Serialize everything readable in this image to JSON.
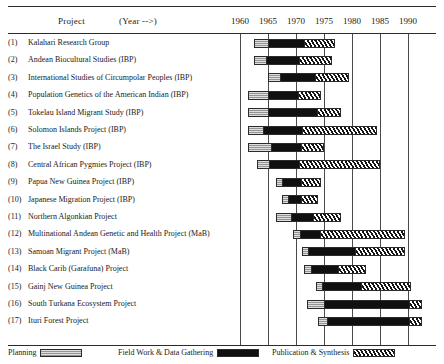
{
  "header": {
    "project_label": "Project",
    "year_label": "(Year -->)"
  },
  "legend": [
    {
      "key": "planning",
      "label": "Planning"
    },
    {
      "key": "field",
      "label": "Field Work & Data Gathering"
    },
    {
      "key": "publication",
      "label": "Publication & Synthesis"
    }
  ],
  "colors": {
    "planning": "#b4b4b4",
    "field": "#101010",
    "publication": "#ffffff",
    "rule": "#2b2b2b",
    "gridline": "#4a4a4a"
  },
  "chart_data": {
    "type": "bar",
    "subtype": "gantt",
    "title": "",
    "xlabel": "(Year -->)",
    "ylabel": "Project",
    "xlim": [
      1958,
      1993
    ],
    "grid": true,
    "legend_position": "bottom",
    "tick_labels": [
      "1960",
      "1965",
      "1970",
      "1975",
      "1980",
      "1985",
      "1990"
    ],
    "ticks": [
      1960,
      1965,
      1970,
      1975,
      1980,
      1985,
      1990
    ],
    "phases": [
      "planning",
      "field",
      "publication"
    ],
    "categories": [
      "Kalahari Research Group",
      "Andean Biocultural Studies (IBP)",
      "International Studies of Circumpolar Peoples (IBP)",
      "Population Genetics of the American Indian (IBP)",
      "Tokelau Island Migrant Study (IBP)",
      "Solomon Islands Project (IBP)",
      "The Israel Study (IBP)",
      "Central African Pygmies Project (IBP)",
      "Papua New Guinea Project (IBP)",
      "Japanese Migration Project (IBP)",
      "Northern Algonkian Project",
      "Multinational Andean Genetic and Health Project (MaB)",
      "Samoan Migrant Project (MaB)",
      "Black Carib (Garafuna) Project",
      "Gainj New Guinea Project",
      "South Turkana Ecosystem Project",
      "Ituri Forest Project"
    ],
    "rows": [
      {
        "num": "(1)",
        "label": "Kalahari Research Group",
        "segments": [
          {
            "phase": "planning",
            "start": 1962.5,
            "end": 1965.0
          },
          {
            "phase": "field",
            "start": 1965.0,
            "end": 1971.5
          },
          {
            "phase": "publication",
            "start": 1971.5,
            "end": 1977.0
          }
        ]
      },
      {
        "num": "(2)",
        "label": "Andean Biocultural Studies (IBP)",
        "segments": [
          {
            "phase": "planning",
            "start": 1962.5,
            "end": 1964.5
          },
          {
            "phase": "field",
            "start": 1964.5,
            "end": 1970.5
          },
          {
            "phase": "publication",
            "start": 1970.5,
            "end": 1976.5
          }
        ]
      },
      {
        "num": "(3)",
        "label": "International Studies of Circumpolar Peoples (IBP)",
        "segments": [
          {
            "phase": "planning",
            "start": 1965.0,
            "end": 1967.0
          },
          {
            "phase": "field",
            "start": 1967.0,
            "end": 1973.5
          },
          {
            "phase": "publication",
            "start": 1973.5,
            "end": 1979.5
          }
        ]
      },
      {
        "num": "(4)",
        "label": "Population Genetics of the American Indian (IBP)",
        "segments": [
          {
            "phase": "planning",
            "start": 1961.5,
            "end": 1965.0
          },
          {
            "phase": "field",
            "start": 1965.0,
            "end": 1970.5
          },
          {
            "phase": "publication",
            "start": 1970.5,
            "end": 1974.5
          }
        ]
      },
      {
        "num": "(5)",
        "label": "Tokelau Island Migrant Study (IBP)",
        "segments": [
          {
            "phase": "planning",
            "start": 1961.5,
            "end": 1965.0
          },
          {
            "phase": "field",
            "start": 1965.0,
            "end": 1974.0
          },
          {
            "phase": "publication",
            "start": 1974.0,
            "end": 1978.0
          }
        ]
      },
      {
        "num": "(6)",
        "label": "Solomon Islands Project (IBP)",
        "segments": [
          {
            "phase": "planning",
            "start": 1961.5,
            "end": 1964.0
          },
          {
            "phase": "field",
            "start": 1964.0,
            "end": 1971.0
          },
          {
            "phase": "publication",
            "start": 1971.0,
            "end": 1984.5
          }
        ]
      },
      {
        "num": "(7)",
        "label": "The Israel Study (IBP)",
        "segments": [
          {
            "phase": "planning",
            "start": 1961.5,
            "end": 1965.5
          },
          {
            "phase": "field",
            "start": 1965.5,
            "end": 1971.0
          },
          {
            "phase": "publication",
            "start": 1971.0,
            "end": 1975.0
          }
        ]
      },
      {
        "num": "(8)",
        "label": "Central African Pygmies Project (IBP)",
        "segments": [
          {
            "phase": "planning",
            "start": 1963.0,
            "end": 1965.0
          },
          {
            "phase": "field",
            "start": 1965.0,
            "end": 1970.5
          },
          {
            "phase": "publication",
            "start": 1970.5,
            "end": 1985.0
          }
        ]
      },
      {
        "num": "(9)",
        "label": "Papua New Guinea Project (IBP)",
        "segments": [
          {
            "phase": "planning",
            "start": 1966.5,
            "end": 1967.5
          },
          {
            "phase": "field",
            "start": 1967.5,
            "end": 1971.0
          },
          {
            "phase": "publication",
            "start": 1971.0,
            "end": 1974.5
          }
        ]
      },
      {
        "num": "(10)",
        "label": "Japanese Migration Project (IBP)",
        "segments": [
          {
            "phase": "planning",
            "start": 1967.5,
            "end": 1968.5
          },
          {
            "phase": "field",
            "start": 1968.5,
            "end": 1971.0
          },
          {
            "phase": "publication",
            "start": 1971.0,
            "end": 1974.0
          }
        ]
      },
      {
        "num": "(11)",
        "label": "Northern Algonkian Project",
        "segments": [
          {
            "phase": "planning",
            "start": 1966.5,
            "end": 1969.0
          },
          {
            "phase": "field",
            "start": 1969.0,
            "end": 1973.0
          },
          {
            "phase": "publication",
            "start": 1973.0,
            "end": 1978.0
          }
        ]
      },
      {
        "num": "(12)",
        "label": "Multinational Andean Genetic and Health Project (MaB)",
        "segments": [
          {
            "phase": "planning",
            "start": 1969.5,
            "end": 1970.5
          },
          {
            "phase": "field",
            "start": 1970.5,
            "end": 1974.0
          },
          {
            "phase": "publication",
            "start": 1974.0,
            "end": 1989.5
          }
        ]
      },
      {
        "num": "(13)",
        "label": "Samoan Migrant Project (MaB)",
        "segments": [
          {
            "phase": "planning",
            "start": 1971.0,
            "end": 1972.0
          },
          {
            "phase": "field",
            "start": 1972.0,
            "end": 1980.5
          },
          {
            "phase": "publication",
            "start": 1980.5,
            "end": 1989.5
          }
        ]
      },
      {
        "num": "(14)",
        "label": "Black Carib (Garafuna) Project",
        "segments": [
          {
            "phase": "planning",
            "start": 1971.5,
            "end": 1972.5
          },
          {
            "phase": "field",
            "start": 1972.5,
            "end": 1977.5
          },
          {
            "phase": "publication",
            "start": 1977.5,
            "end": 1982.5
          }
        ]
      },
      {
        "num": "(15)",
        "label": "Gainj New Guinea Project",
        "segments": [
          {
            "phase": "planning",
            "start": 1973.5,
            "end": 1974.5
          },
          {
            "phase": "field",
            "start": 1974.5,
            "end": 1981.5
          },
          {
            "phase": "publication",
            "start": 1981.5,
            "end": 1990.5
          }
        ]
      },
      {
        "num": "(16)",
        "label": "South Turkana Ecosystem Project",
        "segments": [
          {
            "phase": "planning",
            "start": 1972.0,
            "end": 1975.0
          },
          {
            "phase": "field",
            "start": 1975.0,
            "end": 1990.5
          },
          {
            "phase": "publication",
            "start": 1990.5,
            "end": 1992.5
          }
        ]
      },
      {
        "num": "(17)",
        "label": "Ituri Forest Project",
        "segments": [
          {
            "phase": "planning",
            "start": 1974.0,
            "end": 1975.5
          },
          {
            "phase": "field",
            "start": 1975.5,
            "end": 1990.5
          },
          {
            "phase": "publication",
            "start": 1990.5,
            "end": 1992.5
          }
        ]
      }
    ]
  }
}
